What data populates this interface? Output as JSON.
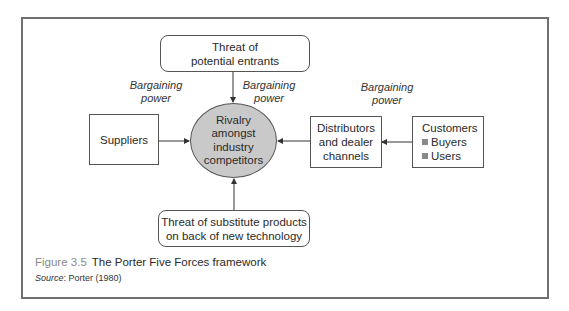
{
  "figure": {
    "number": "Figure 3.5",
    "title": "The Porter Five Forces framework",
    "source_label": "Source",
    "source_text": ": Porter (1980)"
  },
  "diagram": {
    "center": {
      "lines": [
        "Rivalry",
        "amongst",
        "industry",
        "competitors"
      ]
    },
    "top": {
      "lines": [
        "Threat of",
        "potential entrants"
      ]
    },
    "bottom": {
      "lines": [
        "Threat of substitute products",
        "on back of new technology"
      ]
    },
    "left": {
      "label": "Suppliers"
    },
    "distributors": {
      "lines": [
        "Distributors",
        "and dealer",
        "channels"
      ]
    },
    "customers": {
      "title": "Customers",
      "items": [
        "Buyers",
        "Users"
      ]
    },
    "bargaining_labels": [
      {
        "line1": "Bargaining",
        "line2": "power"
      },
      {
        "line1": "Bargaining",
        "line2": "power"
      },
      {
        "line1": "Bargaining",
        "line2": "power"
      }
    ],
    "colors": {
      "center_fill": "#c9c9c9",
      "border": "#555555",
      "frame": "#707070",
      "bullet": "#8a8a8a"
    }
  }
}
